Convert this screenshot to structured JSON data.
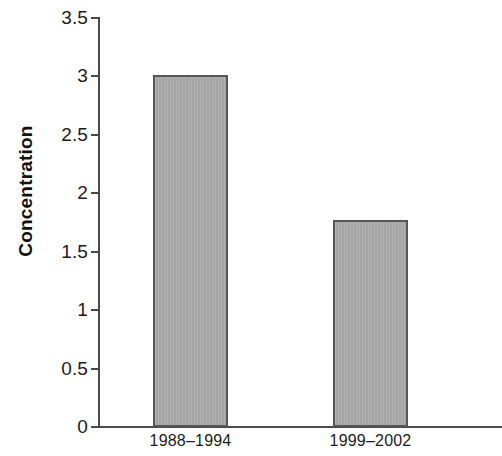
{
  "chart_data": {
    "type": "bar",
    "title": "",
    "xlabel": "",
    "ylabel": "Concentration",
    "categories": [
      "1988–1994",
      "1999–2002"
    ],
    "values": [
      3.01,
      1.77
    ],
    "ylim": [
      0,
      3.5
    ],
    "yticks": [
      "0",
      "0.5",
      "1",
      "1.5",
      "2",
      "2.5",
      "3",
      "3.5"
    ],
    "ytick_values": [
      0,
      0.5,
      1,
      1.5,
      2,
      2.5,
      3,
      3.5
    ],
    "grid": false,
    "legend": null,
    "series": [
      {
        "name": "Concentration",
        "values": [
          3.01,
          1.77
        ],
        "color": "#a9a9a9",
        "edge_color": "#565656"
      }
    ]
  },
  "colors": {
    "bar_fill": "#a9a9a9",
    "bar_edge": "#565656",
    "axis": "#4a4a4a",
    "text": "#1c1c1c",
    "background": "#ffffff"
  }
}
